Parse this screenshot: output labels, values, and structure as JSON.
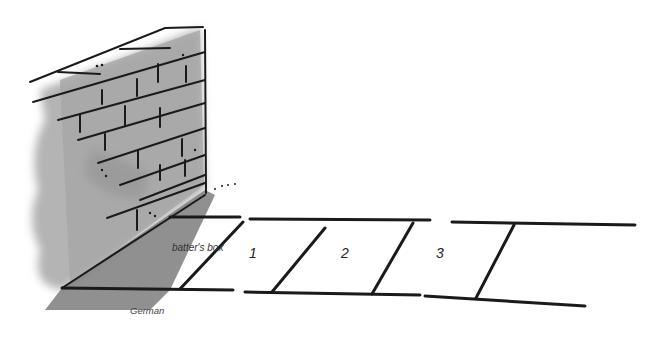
{
  "illustration": {
    "subject": "brick wall with court marked on ground",
    "labels": {
      "batters_box": "batter's box",
      "box_1": "1",
      "box_2": "2",
      "box_3": "3"
    },
    "caption": "German"
  },
  "colors": {
    "ink": "#1a1a1a",
    "wall_shade": "#a8a8a8",
    "wall_dark": "#8c8c8c",
    "shadow": "#7a7a7a",
    "background": "#ffffff"
  }
}
